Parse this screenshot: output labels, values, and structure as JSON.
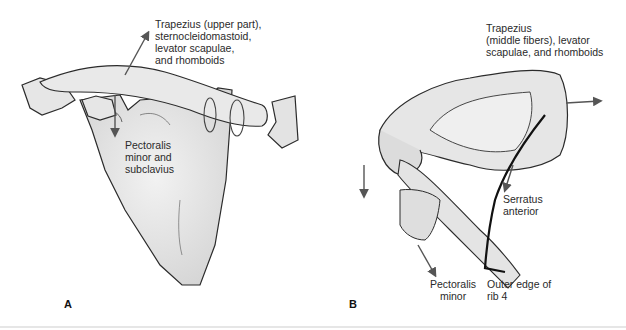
{
  "panels": [
    {
      "letter": "A",
      "labels": {
        "upward": "Trapezius (upper part),\nsternocleidomastoid,\nlevator scapulae,\nand rhomboids",
        "downward": "Pectoralis\nminor and\nsubclavius"
      }
    },
    {
      "letter": "B",
      "labels": {
        "medial": "Trapezius\n(middle fibers), levator\nscapulae, and rhomboids",
        "serratus": "Serratus\nanterior",
        "pectoralis": "Pectoralis\nminor",
        "rib": "Outer edge of\nrib 4"
      }
    }
  ],
  "colors": {
    "bone_fill": "#e3e3e3",
    "outline": "#2b2b2b",
    "arrow": "#555555"
  }
}
